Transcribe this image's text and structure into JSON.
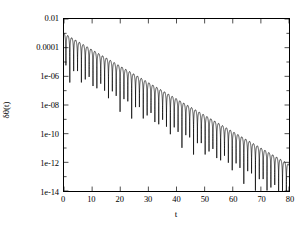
{
  "chart_data": {
    "type": "line",
    "title": "",
    "subtitle": "",
    "xlabel": "t",
    "ylabel": "δθ(t)",
    "xlim": [
      0,
      80
    ],
    "ylim": [
      1e-14,
      0.01
    ],
    "yscale": "log",
    "xscale": "linear",
    "grid": false,
    "legend": null,
    "xticks": [
      0,
      10,
      20,
      30,
      40,
      50,
      60,
      70,
      80
    ],
    "xtick_labels": [
      "0",
      "10",
      "20",
      "30",
      "40",
      "50",
      "60",
      "70",
      "80"
    ],
    "yticks": [
      0.01,
      0.0001,
      1e-06,
      1e-08,
      1e-10,
      1e-12,
      1e-14
    ],
    "ytick_labels": [
      "0.01",
      "0.0001",
      "1e-06",
      "1e-08",
      "1e-10",
      "1e-12",
      "1e-14"
    ],
    "y_minor_ticks": [
      0.001,
      1e-05,
      1e-07,
      1e-09,
      1e-11,
      1e-13
    ],
    "series": [
      {
        "name": "δθ(t)",
        "color": "#000000",
        "envelope_amplitude_at_t0": 0.001,
        "envelope_decay_rate_per_unit_t": 0.263,
        "oscillation_period": 2.75,
        "zero_crossing_count": 29,
        "envelope_points": [
          {
            "t": 0,
            "y": 0.001
          },
          {
            "t": 10,
            "y": 7.2e-05
          },
          {
            "t": 20,
            "y": 5.2e-06
          },
          {
            "t": 30,
            "y": 3.7e-07
          },
          {
            "t": 40,
            "y": 2.7e-08
          },
          {
            "t": 50,
            "y": 1.9e-09
          },
          {
            "t": 60,
            "y": 1.4e-10
          },
          {
            "t": 70,
            "y": 1e-11
          },
          {
            "t": 80,
            "y": 7.2e-13
          }
        ]
      }
    ]
  },
  "figure": {
    "background_color": "#ffffff",
    "axis_color": "#000000",
    "curve_color": "#000000"
  }
}
